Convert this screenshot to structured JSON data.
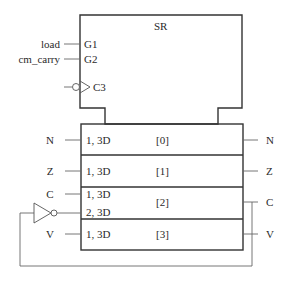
{
  "diagram": {
    "title": "SR",
    "control_block": {
      "inputs": [
        {
          "signal": "load",
          "pin": "G1"
        },
        {
          "signal": "cm_carry",
          "pin": "G2"
        }
      ],
      "clock": {
        "pin": "C3",
        "inverted": true
      }
    },
    "register_cells": [
      {
        "index": "[0]",
        "left_labels": [
          "1, 3D"
        ],
        "input": "N",
        "output": "N"
      },
      {
        "index": "[1]",
        "left_labels": [
          "1, 3D"
        ],
        "input": "Z",
        "output": "Z"
      },
      {
        "index": "[2]",
        "left_labels": [
          "1, 3D",
          "2, 3D"
        ],
        "input": "C",
        "output": "C"
      },
      {
        "index": "[3]",
        "left_labels": [
          "1, 3D"
        ],
        "input": "V",
        "output": "V"
      }
    ],
    "feedback": "Outputs C and V are joined and fed back through an inverter to input 2, 3D of cell [2]"
  }
}
